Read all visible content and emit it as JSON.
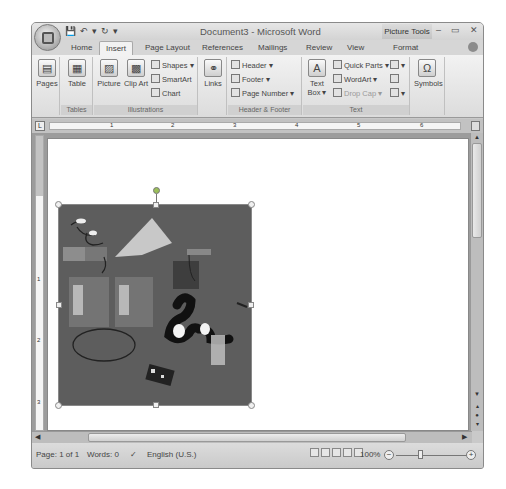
{
  "window": {
    "title": "Document3 - Microsoft Word",
    "contextual_tab_group": "Picture Tools",
    "controls": {
      "minimize": "–",
      "maximize": "▭",
      "close": "✕"
    }
  },
  "quick_access": {
    "save": "💾",
    "undo": "↶",
    "undo_arrow": "▾",
    "redo": "↻",
    "customize": "▾"
  },
  "tabs": [
    {
      "label": "Home",
      "active": false
    },
    {
      "label": "Insert",
      "active": true
    },
    {
      "label": "Page Layout",
      "active": false
    },
    {
      "label": "References",
      "active": false
    },
    {
      "label": "Mailings",
      "active": false
    },
    {
      "label": "Review",
      "active": false
    },
    {
      "label": "View",
      "active": false
    },
    {
      "label": "Format",
      "active": false
    }
  ],
  "ribbon": {
    "groups": {
      "pages": {
        "label": "",
        "buttons": {
          "pages": "Pages"
        }
      },
      "tables": {
        "label": "Tables",
        "buttons": {
          "table": "Table"
        }
      },
      "illustrations": {
        "label": "Illustrations",
        "buttons": {
          "picture": "Picture",
          "clip_art": "Clip Art",
          "shapes": "Shapes ▾",
          "smartart": "SmartArt",
          "chart": "Chart"
        }
      },
      "links": {
        "label": "",
        "buttons": {
          "links": "Links"
        }
      },
      "header_footer": {
        "label": "Header & Footer",
        "buttons": {
          "header": "Header ▾",
          "footer": "Footer ▾",
          "page_number": "Page Number ▾"
        }
      },
      "text": {
        "label": "Text",
        "buttons": {
          "text_box": "Text Box ▾",
          "quick_parts": "Quick Parts ▾",
          "wordart": "WordArt ▾",
          "drop_cap": "Drop Cap ▾"
        }
      },
      "symbols": {
        "label": "",
        "buttons": {
          "symbols": "Symbols"
        }
      }
    }
  },
  "ruler": {
    "marks": [
      "1",
      "2",
      "3",
      "4",
      "5",
      "6"
    ],
    "vertical_marks": [
      "1",
      "2",
      "3"
    ]
  },
  "status_bar": {
    "page": "Page: 1 of 1",
    "words": "Words: 0",
    "language": "English (U.S.)",
    "zoom": "100%"
  },
  "colors": {
    "picture_bg": "#5d5d5d",
    "rotation_handle": "#9bbf5a"
  }
}
